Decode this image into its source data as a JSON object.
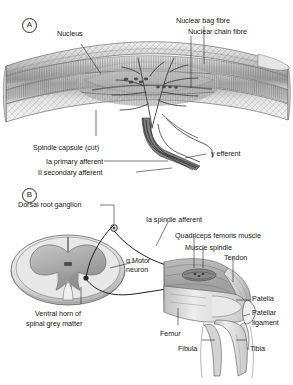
{
  "figure": {
    "type": "anatomy-diagram",
    "panels": [
      {
        "id": "A",
        "tag": "A",
        "name": "muscle-spindle-detail",
        "caption": "Muscle spindle longitudinal section",
        "labels": [
          {
            "key": "nucleus",
            "text": "Nucleus"
          },
          {
            "key": "nuclear_bag_fibre",
            "text": "Nuclear bag fibre"
          },
          {
            "key": "nuclear_chain_fibre",
            "text": "Nuclear chain fibre"
          },
          {
            "key": "spindle_capsule_cut",
            "text": "Spindle capsule (cut)"
          },
          {
            "key": "ia_primary_afferent",
            "text": "Ia primary afferent"
          },
          {
            "key": "ii_secondary_afferent",
            "text": "II secondary afferent"
          },
          {
            "key": "gamma_efferent",
            "text": "γ efferent"
          }
        ]
      },
      {
        "id": "B",
        "tag": "B",
        "name": "stretch-reflex-arc",
        "caption": "Spinal cord and knee jerk reflex arc",
        "labels": [
          {
            "key": "dorsal_root_ganglion",
            "text": "Dorsal root ganglion"
          },
          {
            "key": "ia_spindle_afferent",
            "text": "Ia spindle afferent"
          },
          {
            "key": "quadriceps_femoris_muscle",
            "text": "Quadriceps femoris muscle"
          },
          {
            "key": "muscle_spindle",
            "text": "Muscle spindle"
          },
          {
            "key": "tendon",
            "text": "Tendon"
          },
          {
            "key": "alpha_motor_neuron_line1",
            "text": "α Motor"
          },
          {
            "key": "alpha_motor_neuron_line2",
            "text": "neuron"
          },
          {
            "key": "ventral_horn_line1",
            "text": "Ventral horn of"
          },
          {
            "key": "ventral_horn_line2",
            "text": "spinal grey matter"
          },
          {
            "key": "patella",
            "text": "Patella"
          },
          {
            "key": "patellar_ligament_line1",
            "text": "Patellar"
          },
          {
            "key": "patellar_ligament_line2",
            "text": "ligament"
          },
          {
            "key": "femur",
            "text": "Femur"
          },
          {
            "key": "fibula",
            "text": "Fibula"
          },
          {
            "key": "tibia",
            "text": "Tibia"
          }
        ]
      }
    ],
    "colors": {
      "background": "#ffffff",
      "line": "#2b2b2b",
      "text": "#171717",
      "tissue_light": "#e9e9e9",
      "tissue_mid": "#c9c9c9",
      "tissue_dark": "#9a9a9a",
      "nerve": "#3a3a3a",
      "bone": "#dcdcdc",
      "muscle": "#b5b5b5"
    }
  }
}
